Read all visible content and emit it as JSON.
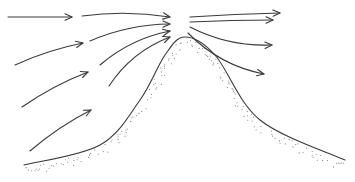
{
  "diagram": {
    "colors": {
      "line": "#3a3a3a",
      "stipple": "#7a7a7a",
      "background": "#ffffff"
    },
    "ground": {
      "profile": [
        [
          24,
          165
        ],
        [
          100,
          145
        ],
        [
          140,
          100
        ],
        [
          165,
          55
        ],
        [
          185,
          37
        ],
        [
          215,
          55
        ],
        [
          260,
          120
        ],
        [
          345,
          160
        ]
      ]
    },
    "arrows_windward_outer": [
      {
        "from": [
          8,
          17
        ],
        "to": [
          72,
          17
        ]
      },
      {
        "from": [
          15,
          65
        ],
        "to": [
          83,
          43
        ]
      },
      {
        "from": [
          22,
          107
        ],
        "to": [
          88,
          72
        ]
      },
      {
        "from": [
          30,
          151
        ],
        "to": [
          91,
          110
        ]
      }
    ],
    "arrows_windward_inner": [
      {
        "from": [
          82,
          16
        ],
        "to": [
          170,
          17
        ]
      },
      {
        "from": [
          90,
          41
        ],
        "to": [
          170,
          24
        ]
      },
      {
        "from": [
          100,
          65
        ],
        "to": [
          170,
          31
        ]
      },
      {
        "from": [
          109,
          86
        ],
        "to": [
          170,
          37
        ]
      }
    ],
    "arrows_leeward": [
      {
        "from": [
          190,
          17
        ],
        "to": [
          280,
          13
        ]
      },
      {
        "from": [
          190,
          22
        ],
        "to": [
          273,
          20
        ]
      },
      {
        "from": [
          190,
          27
        ],
        "to": [
          272,
          45
        ]
      },
      {
        "from": [
          188,
          33
        ],
        "to": [
          264,
          74
        ]
      }
    ]
  }
}
